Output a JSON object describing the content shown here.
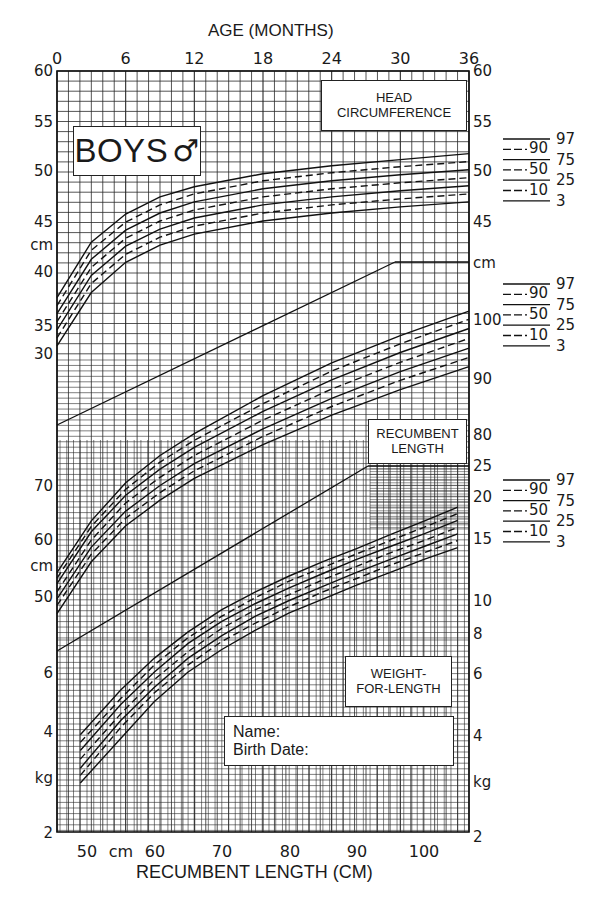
{
  "labels": {
    "boys": "BOYS",
    "male_symbol": "♂",
    "head_circumference": [
      "HEAD",
      "CIRCUMFERENCE"
    ],
    "recumbent_length": [
      "RECUMBENT",
      "LENGTH"
    ],
    "weight_for_length": [
      "WEIGHT-",
      "FOR-LENGTH"
    ],
    "name_field": "Name:",
    "birth_date_field": "Birth Date:"
  },
  "chart_data": [
    {
      "type": "line",
      "title": "Head Circumference-for-Age",
      "xlabel": "AGE (MONTHS)",
      "ylabel": "cm",
      "x_ticks": [
        0,
        6,
        12,
        18,
        24,
        30,
        36
      ],
      "xlim": [
        0,
        36
      ],
      "ylim": [
        30,
        60
      ],
      "y_ticks_left": [
        60,
        55,
        50,
        45,
        40,
        35,
        30
      ],
      "y_ticks_right": [
        60,
        55,
        50,
        45
      ],
      "x": [
        0,
        3,
        6,
        9,
        12,
        18,
        24,
        30,
        36
      ],
      "series": [
        {
          "name": "97",
          "style": "solid",
          "values": [
            37.5,
            43.0,
            45.8,
            47.5,
            48.5,
            49.8,
            50.6,
            51.2,
            51.8
          ]
        },
        {
          "name": "90",
          "style": "dashed",
          "values": [
            36.7,
            42.2,
            45.0,
            46.7,
            47.8,
            49.1,
            49.9,
            50.5,
            51.0
          ]
        },
        {
          "name": "75",
          "style": "solid",
          "values": [
            35.9,
            41.3,
            44.2,
            45.9,
            47.0,
            48.3,
            49.1,
            49.7,
            50.2
          ]
        },
        {
          "name": "50",
          "style": "dashed",
          "values": [
            35.1,
            40.5,
            43.4,
            45.1,
            46.2,
            47.5,
            48.3,
            48.9,
            49.4
          ]
        },
        {
          "name": "25",
          "style": "solid",
          "values": [
            34.3,
            39.7,
            42.6,
            44.3,
            45.4,
            46.7,
            47.5,
            48.1,
            48.6
          ]
        },
        {
          "name": "10",
          "style": "dashed",
          "values": [
            33.5,
            38.9,
            41.8,
            43.5,
            44.6,
            45.9,
            46.7,
            47.3,
            47.8
          ]
        },
        {
          "name": "3",
          "style": "solid",
          "values": [
            32.7,
            38.0,
            41.0,
            42.7,
            43.8,
            45.1,
            45.9,
            46.5,
            47.0
          ]
        }
      ],
      "legend": [
        "97",
        "90",
        "75",
        "50",
        "25",
        "10",
        "3"
      ]
    },
    {
      "type": "line",
      "title": "Recumbent Length-for-Age",
      "xlabel": "AGE (MONTHS)",
      "ylabel": "cm",
      "xlim": [
        0,
        36
      ],
      "y_ticks_left": [
        70,
        60,
        50
      ],
      "y_ticks_right": [
        100,
        90,
        80
      ],
      "x": [
        0,
        3,
        6,
        9,
        12,
        18,
        24,
        30,
        36
      ],
      "series": [
        {
          "name": "97",
          "style": "solid",
          "values": [
            54.0,
            63.5,
            70.5,
            75.5,
            79.5,
            86.5,
            92.5,
            97.5,
            102.0
          ]
        },
        {
          "name": "90",
          "style": "dashed",
          "values": [
            53.0,
            62.5,
            69.3,
            74.3,
            78.3,
            85.0,
            91.0,
            96.0,
            100.5
          ]
        },
        {
          "name": "75",
          "style": "solid",
          "values": [
            52.0,
            61.5,
            68.2,
            73.0,
            77.0,
            83.6,
            89.4,
            94.4,
            98.8
          ]
        },
        {
          "name": "50",
          "style": "dashed",
          "values": [
            50.5,
            60.0,
            66.8,
            71.5,
            75.5,
            82.0,
            87.7,
            92.6,
            97.0
          ]
        },
        {
          "name": "25",
          "style": "solid",
          "values": [
            49.2,
            58.7,
            65.3,
            70.0,
            74.0,
            80.4,
            86.0,
            90.9,
            95.2
          ]
        },
        {
          "name": "10",
          "style": "dashed",
          "values": [
            48.0,
            57.4,
            64.0,
            68.7,
            72.7,
            79.0,
            84.5,
            89.3,
            93.5
          ]
        },
        {
          "name": "3",
          "style": "solid",
          "values": [
            46.5,
            56.0,
            62.6,
            67.3,
            71.3,
            77.5,
            82.9,
            87.6,
            91.8
          ]
        }
      ],
      "legend": [
        "97",
        "90",
        "75",
        "50",
        "25",
        "10",
        "3"
      ]
    },
    {
      "type": "line",
      "title": "Weight-for-Length",
      "xlabel": "RECUMBENT LENGTH (CM)",
      "ylabel": "kg",
      "x_ticks": [
        50,
        60,
        70,
        80,
        90,
        100
      ],
      "x_unit_label": "cm",
      "xlim": [
        45,
        106
      ],
      "y_ticks_left": [
        6,
        4,
        2
      ],
      "y_ticks_right": [
        25,
        20,
        15,
        10,
        8,
        6,
        4,
        2
      ],
      "y_scale": "log",
      "x": [
        49,
        55,
        60,
        65,
        70,
        75,
        80,
        85,
        90,
        95,
        100,
        105
      ],
      "series": [
        {
          "name": "97",
          "style": "solid",
          "values": [
            3.9,
            5.3,
            6.6,
            7.9,
            9.2,
            10.4,
            11.6,
            12.8,
            14.0,
            15.4,
            16.9,
            18.6
          ]
        },
        {
          "name": "90",
          "style": "dashed",
          "values": [
            3.7,
            5.0,
            6.3,
            7.6,
            8.8,
            10.0,
            11.2,
            12.3,
            13.5,
            14.8,
            16.2,
            17.8
          ]
        },
        {
          "name": "75",
          "style": "solid",
          "values": [
            3.5,
            4.8,
            6.0,
            7.3,
            8.5,
            9.6,
            10.7,
            11.8,
            13.0,
            14.2,
            15.5,
            17.0
          ]
        },
        {
          "name": "50",
          "style": "dashed",
          "values": [
            3.3,
            4.5,
            5.7,
            6.9,
            8.1,
            9.2,
            10.2,
            11.3,
            12.4,
            13.6,
            14.8,
            16.2
          ]
        },
        {
          "name": "25",
          "style": "solid",
          "values": [
            3.1,
            4.3,
            5.4,
            6.6,
            7.7,
            8.8,
            9.8,
            10.8,
            11.9,
            13.0,
            14.2,
            15.5
          ]
        },
        {
          "name": "10",
          "style": "dashed",
          "values": [
            2.95,
            4.1,
            5.2,
            6.3,
            7.4,
            8.4,
            9.4,
            10.4,
            11.4,
            12.5,
            13.6,
            14.8
          ]
        },
        {
          "name": "3",
          "style": "solid",
          "values": [
            2.8,
            3.8,
            4.9,
            6.0,
            7.0,
            8.0,
            9.0,
            9.9,
            10.9,
            11.9,
            13.0,
            14.1
          ]
        }
      ],
      "legend": [
        "97",
        "90",
        "75",
        "50",
        "25",
        "10",
        "3"
      ]
    }
  ],
  "axes": {
    "top_title": "AGE (MONTHS)",
    "top_ticks": [
      "0",
      "6",
      "12",
      "18",
      "24",
      "30",
      "36"
    ],
    "bottom_title": "RECUMBENT LENGTH (CM)",
    "bottom_ticks": [
      "50",
      "cm",
      "60",
      "70",
      "80",
      "90",
      "100"
    ],
    "left_ticks": [
      {
        "t": "60",
        "y": 76
      },
      {
        "t": "55",
        "y": 127
      },
      {
        "t": "50",
        "y": 176
      },
      {
        "t": "45",
        "y": 227
      },
      {
        "t": "cm",
        "y": 250
      },
      {
        "t": "40",
        "y": 277
      },
      {
        "t": "35",
        "y": 331
      },
      {
        "t": "30",
        "y": 359
      },
      {
        "t": "70",
        "y": 491
      },
      {
        "t": "60",
        "y": 545
      },
      {
        "t": "cm",
        "y": 571
      },
      {
        "t": "50",
        "y": 602
      },
      {
        "t": "6",
        "y": 678
      },
      {
        "t": "4",
        "y": 737
      },
      {
        "t": "kg",
        "y": 783
      },
      {
        "t": "2",
        "y": 838
      }
    ],
    "right_ticks": [
      {
        "t": "60",
        "y": 76
      },
      {
        "t": "55",
        "y": 127
      },
      {
        "t": "50",
        "y": 176
      },
      {
        "t": "45",
        "y": 227
      },
      {
        "t": "cm",
        "y": 268
      },
      {
        "t": "100",
        "y": 325
      },
      {
        "t": "90",
        "y": 384
      },
      {
        "t": "80",
        "y": 440
      },
      {
        "t": "25",
        "y": 471
      },
      {
        "t": "20",
        "y": 502
      },
      {
        "t": "15",
        "y": 544
      },
      {
        "t": "10",
        "y": 606
      },
      {
        "t": "8",
        "y": 639
      },
      {
        "t": "6",
        "y": 679
      },
      {
        "t": "4",
        "y": 741
      },
      {
        "t": "kg",
        "y": 787
      },
      {
        "t": "2",
        "y": 842
      }
    ]
  },
  "legends": [
    {
      "top": 139,
      "items": [
        "97",
        "90",
        "75",
        "50",
        "25",
        "10",
        "3"
      ]
    },
    {
      "top": 284,
      "items": [
        "97",
        "90",
        "75",
        "50",
        "25",
        "10",
        "3"
      ]
    },
    {
      "top": 480,
      "items": [
        "97",
        "90",
        "75",
        "50",
        "25",
        "10",
        "3"
      ]
    }
  ]
}
